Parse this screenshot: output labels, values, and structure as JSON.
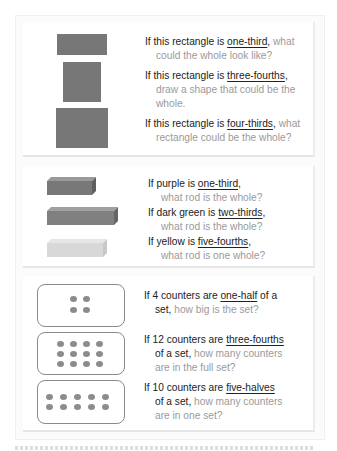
{
  "rectangles_section": {
    "shapes": [
      {
        "name": "rectangle-1",
        "color": "#777777"
      },
      {
        "name": "rectangle-2",
        "color": "#777777"
      },
      {
        "name": "rectangle-3",
        "color": "#777777"
      }
    ],
    "questions": [
      {
        "pre": "If this rectangle is ",
        "key": "one-third",
        "post": ",",
        "tail_inline": " what",
        "cont": "could the whole look like?"
      },
      {
        "pre": "If this rectangle is ",
        "key": "three-fourths",
        "post": ",",
        "tail_inline": "",
        "cont": "draw a shape that could be the",
        "cont2": "whole."
      },
      {
        "pre": "If this rectangle is ",
        "key": "four-thirds",
        "post": ",",
        "tail_inline": " what",
        "cont": "rectangle could be the whole?"
      }
    ]
  },
  "rods_section": {
    "rods": [
      {
        "name": "purple",
        "color": "#7a7a7a"
      },
      {
        "name": "dark-green",
        "color": "#7f7f7f"
      },
      {
        "name": "yellow",
        "color": "#d9d9d9"
      }
    ],
    "questions": [
      {
        "pre": "If purple is ",
        "key": "one-third",
        "post": ",",
        "cont": "what rod is the whole?"
      },
      {
        "pre": "If dark green is ",
        "key": "two-thirds",
        "post": ",",
        "cont": "what rod is the whole?"
      },
      {
        "pre": "If yellow is ",
        "key": "five-fourths",
        "post": ",",
        "cont": "what rod is one whole?"
      }
    ]
  },
  "counters_section": {
    "sets": [
      {
        "count": 4,
        "rows": 2,
        "cols": 2
      },
      {
        "count": 12,
        "rows": 3,
        "cols": 4
      },
      {
        "count": 10,
        "rows": 2,
        "cols": 5
      }
    ],
    "questions": [
      {
        "pre": "If 4 counters are ",
        "key": "one-half",
        "post": " of a",
        "cont_dark": "set,",
        "cont_muted": " how big is the set?"
      },
      {
        "pre": "If 12 counters are ",
        "key": "three-fourths",
        "post": "",
        "cont_dark": "of a set,",
        "cont_muted": " how many counters",
        "cont2": "are in the full set?"
      },
      {
        "pre": "If 10 counters are ",
        "key": "five-halves",
        "post": "",
        "cont_dark": "of a set,",
        "cont_muted": " how many counters",
        "cont2": "are in one set?"
      }
    ]
  }
}
